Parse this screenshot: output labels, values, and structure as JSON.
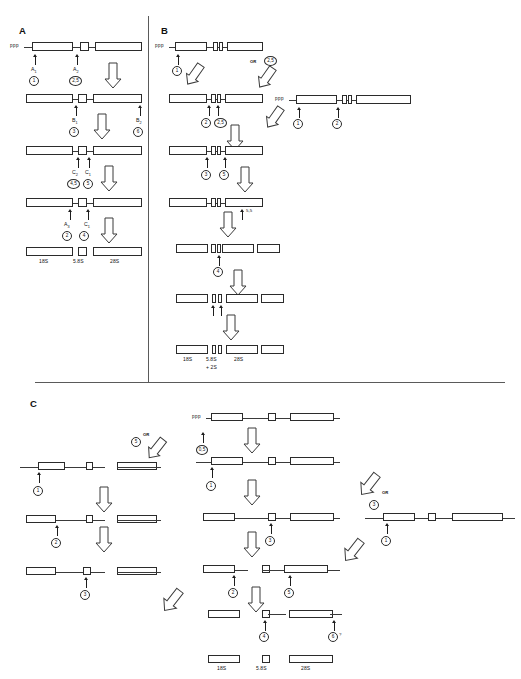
{
  "figure": {
    "type": "rRNA processing pathway diagram",
    "panels": [
      {
        "id": "A",
        "label": "A"
      },
      {
        "id": "B",
        "label": "B"
      },
      {
        "id": "C",
        "label": "C"
      }
    ]
  },
  "glyphs": {
    "ppp": "ppp",
    "or": "OR",
    "question": "?"
  },
  "panelA": {
    "letter": "A",
    "precursor_end_label": "ppp",
    "cut_sites": {
      "a1": "A₁",
      "a2": "A₂",
      "b1": "B₁",
      "b2": "B₂",
      "c2": "C₂",
      "c1": "C₁",
      "a3": "A₃",
      "c1b": "C₁"
    },
    "enzymes": {
      "e1": "1",
      "e25": "2,5",
      "e3": "3",
      "e6": "6",
      "e45": "4,5",
      "e5": "5",
      "e2": "2",
      "e4": "4"
    },
    "products": {
      "p18s": "18S",
      "p58s": "5.8S",
      "p28s": "28S"
    }
  },
  "panelB": {
    "letter": "B",
    "precursor_end_label": "ppp",
    "alt_precursor_end_label": "ppp",
    "or_label": "OR",
    "cut_sites": {
      "s55": "5,5"
    },
    "enzymes": {
      "e1": "1",
      "e25_top": "2,5",
      "e2": "2",
      "e25": "2,5",
      "e1_right": "1",
      "e2_right": "2",
      "e3": "3",
      "e5": "5",
      "e4": "4"
    },
    "products": {
      "p18s": "18S",
      "p58s": "5.8S",
      "p58s_line2": "+ 2S",
      "p28s": "28S"
    }
  },
  "panelC": {
    "letter": "C",
    "precursor_end_label": "ppp",
    "or_label_left": "OR",
    "or_label_right": "OR",
    "enzymes": {
      "left_e1": "1",
      "left_e2": "2",
      "left_e3": "3",
      "left_e5": "5",
      "mid_e05": "0,5",
      "mid_e1": "1",
      "mid_e3": "3",
      "mid_e2": "2",
      "mid_e5": "5",
      "mid_e4": "4",
      "mid_e6": "6",
      "right_e3": "3",
      "right_e1": "1"
    },
    "annotations": {
      "e6_question": "?"
    },
    "products": {
      "p18s": "18S",
      "p58s": "5.8S",
      "p28s": "28S"
    }
  }
}
